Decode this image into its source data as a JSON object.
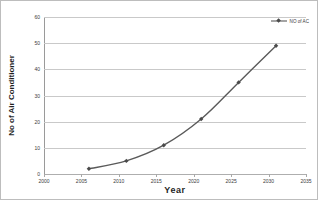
{
  "chart_data": {
    "type": "line",
    "title": "",
    "xlabel": "Year",
    "ylabel": "No of Air Conditioner",
    "x": [
      2006,
      2011,
      2016,
      2021,
      2026,
      2031
    ],
    "series": [
      {
        "name": "NO of AC",
        "values": [
          2,
          5,
          11,
          21,
          35,
          49
        ]
      }
    ],
    "xlim": [
      2000,
      2035
    ],
    "ylim": [
      0,
      60
    ],
    "xticks": [
      2000,
      2005,
      2010,
      2015,
      2020,
      2025,
      2030,
      2035
    ],
    "yticks": [
      0,
      10,
      20,
      30,
      40,
      50,
      60
    ],
    "xtick_labels": [
      "2000",
      "2005",
      "2010",
      "2015",
      "2020",
      "2025",
      "2030",
      "2035"
    ],
    "ytick_labels": [
      "0",
      "10",
      "20",
      "30",
      "40",
      "50",
      "60"
    ],
    "grid": "horizontal",
    "legend_position": "top-right",
    "legend_entries": [
      "NO of AC"
    ],
    "series_color": "#5a5a5a",
    "marker_color": "#4a4a4a",
    "grid_color": "#c9c9c9",
    "axis_color": "#9a9a9a"
  }
}
